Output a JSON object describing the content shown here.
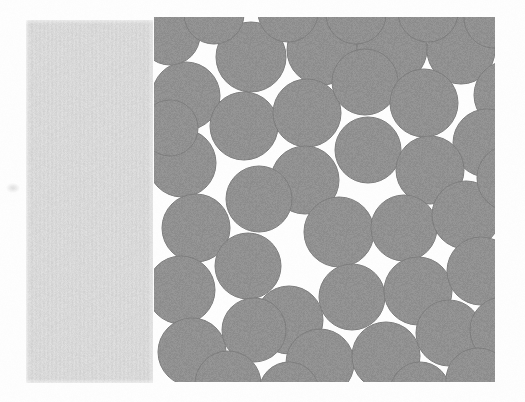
{
  "figure": {
    "kind": "scanned-scientific-figure",
    "canvas": {
      "width": 525,
      "height": 402
    },
    "background_color": "#fefefe"
  },
  "gray_slab": {
    "label": "uniform light gray slab",
    "fill_color": "#d6d6d6",
    "edge_color": "#c9c9c9",
    "x": 26,
    "y": 20,
    "width": 127,
    "height": 363
  },
  "packing": {
    "label": "random disk packing",
    "disk_fill_color": "#878787",
    "disk_edge_color": "#6f6f6f",
    "region": {
      "x": 154,
      "y": 17,
      "width": 341,
      "height": 365
    },
    "disk_count": 44,
    "nominal_diameter": 66,
    "disks": [
      {
        "cx": 186,
        "cy": 96,
        "r": 34
      },
      {
        "cx": 251,
        "cy": 57,
        "r": 35
      },
      {
        "cx": 322,
        "cy": 50,
        "r": 35
      },
      {
        "cx": 392,
        "cy": 49,
        "r": 35
      },
      {
        "cx": 461,
        "cy": 50,
        "r": 34
      },
      {
        "cx": 508,
        "cy": 95,
        "r": 34
      },
      {
        "cx": 244,
        "cy": 126,
        "r": 34
      },
      {
        "cx": 307,
        "cy": 113,
        "r": 34
      },
      {
        "cx": 365,
        "cy": 82,
        "r": 33
      },
      {
        "cx": 424,
        "cy": 103,
        "r": 34
      },
      {
        "cx": 487,
        "cy": 143,
        "r": 34
      },
      {
        "cx": 182,
        "cy": 163,
        "r": 34
      },
      {
        "cx": 305,
        "cy": 180,
        "r": 34
      },
      {
        "cx": 368,
        "cy": 150,
        "r": 33
      },
      {
        "cx": 430,
        "cy": 170,
        "r": 34
      },
      {
        "cx": 196,
        "cy": 228,
        "r": 34
      },
      {
        "cx": 259,
        "cy": 199,
        "r": 33
      },
      {
        "cx": 339,
        "cy": 232,
        "r": 35
      },
      {
        "cx": 404,
        "cy": 228,
        "r": 33
      },
      {
        "cx": 466,
        "cy": 215,
        "r": 34
      },
      {
        "cx": 510,
        "cy": 178,
        "r": 33
      },
      {
        "cx": 181,
        "cy": 290,
        "r": 34
      },
      {
        "cx": 248,
        "cy": 266,
        "r": 33
      },
      {
        "cx": 289,
        "cy": 320,
        "r": 34
      },
      {
        "cx": 352,
        "cy": 297,
        "r": 33
      },
      {
        "cx": 418,
        "cy": 291,
        "r": 34
      },
      {
        "cx": 481,
        "cy": 271,
        "r": 34
      },
      {
        "cx": 192,
        "cy": 352,
        "r": 34
      },
      {
        "cx": 254,
        "cy": 330,
        "r": 32
      },
      {
        "cx": 320,
        "cy": 363,
        "r": 34
      },
      {
        "cx": 386,
        "cy": 356,
        "r": 34
      },
      {
        "cx": 449,
        "cy": 333,
        "r": 33
      },
      {
        "cx": 503,
        "cy": 330,
        "r": 33
      },
      {
        "cx": 228,
        "cy": 384,
        "r": 33
      },
      {
        "cx": 289,
        "cy": 392,
        "r": 30
      },
      {
        "cx": 420,
        "cy": 392,
        "r": 30
      },
      {
        "cx": 478,
        "cy": 380,
        "r": 32
      },
      {
        "cx": 170,
        "cy": 35,
        "r": 30
      },
      {
        "cx": 214,
        "cy": 14,
        "r": 30
      },
      {
        "cx": 288,
        "cy": 12,
        "r": 30
      },
      {
        "cx": 356,
        "cy": 14,
        "r": 30
      },
      {
        "cx": 428,
        "cy": 12,
        "r": 30
      },
      {
        "cx": 494,
        "cy": 18,
        "r": 30
      },
      {
        "cx": 170,
        "cy": 128,
        "r": 28
      }
    ]
  },
  "artifacts": {
    "corner_smudge": {
      "x": 6,
      "y": 183,
      "label": "scan smudge"
    }
  }
}
